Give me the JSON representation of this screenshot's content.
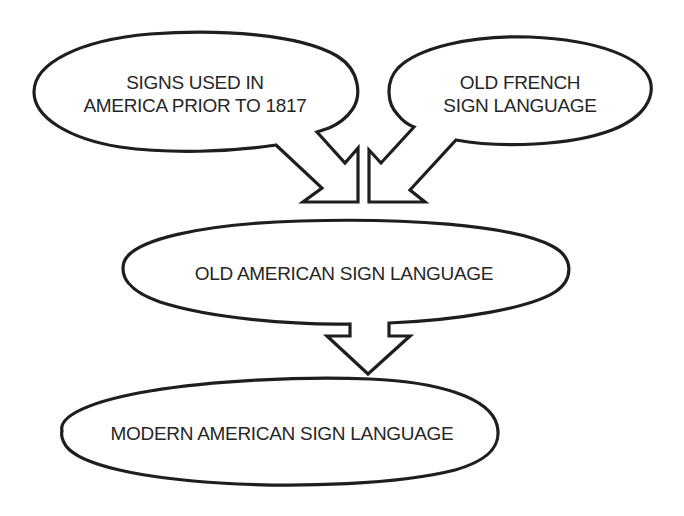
{
  "diagram": {
    "type": "flow",
    "direction": "top-to-bottom",
    "colors": {
      "background": "#ffffff",
      "outline": "#1e1e1e",
      "text": "#262626"
    },
    "nodes": [
      {
        "id": "signs-prior-1817",
        "line1": "SIGNS USED IN",
        "line2": "AMERICA PRIOR TO 1817",
        "shape": "speech-bubble"
      },
      {
        "id": "old-french",
        "line1": "OLD FRENCH",
        "line2": "SIGN LANGUAGE",
        "shape": "speech-bubble"
      },
      {
        "id": "old-american",
        "line1": "OLD AMERICAN SIGN LANGUAGE",
        "shape": "speech-bubble"
      },
      {
        "id": "modern-american",
        "line1": "MODERN AMERICAN SIGN LANGUAGE",
        "shape": "ellipse"
      }
    ],
    "edges": [
      {
        "from": "signs-prior-1817",
        "to": "old-american",
        "style": "block-arrow"
      },
      {
        "from": "old-french",
        "to": "old-american",
        "style": "block-arrow"
      },
      {
        "from": "old-american",
        "to": "modern-american",
        "style": "block-arrow"
      }
    ]
  }
}
